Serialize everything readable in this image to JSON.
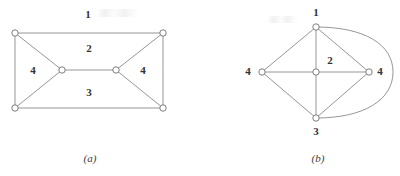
{
  "figure": {
    "caption_a": "(a)",
    "caption_b": "(b)"
  },
  "diagram_a": {
    "name": "planar-graph-a",
    "face_labels": [
      {
        "id": "outer-face-label-1",
        "text": "1",
        "x": 88,
        "y": 14
      },
      {
        "id": "face-label-upper-2",
        "text": "2",
        "x": 89,
        "y": 48
      },
      {
        "id": "face-label-lower-3",
        "text": "3",
        "x": 89,
        "y": 92
      },
      {
        "id": "face-label-left-4",
        "text": "4",
        "x": 33,
        "y": 70
      },
      {
        "id": "face-label-right-4",
        "text": "4",
        "x": 143,
        "y": 70
      }
    ],
    "vertices": [
      {
        "id": "v-top-left",
        "x": 15,
        "y": 33
      },
      {
        "id": "v-top-right",
        "x": 163,
        "y": 33
      },
      {
        "id": "v-bottom-left",
        "x": 15,
        "y": 108
      },
      {
        "id": "v-bottom-right",
        "x": 163,
        "y": 108
      },
      {
        "id": "v-mid-left",
        "x": 62,
        "y": 70
      },
      {
        "id": "v-mid-right",
        "x": 116,
        "y": 70
      }
    ],
    "edges": [
      {
        "id": "edge-top",
        "from": "v-top-left",
        "to": "v-top-right"
      },
      {
        "id": "edge-bottom",
        "from": "v-bottom-left",
        "to": "v-bottom-right"
      },
      {
        "id": "edge-left",
        "from": "v-top-left",
        "to": "v-bottom-left"
      },
      {
        "id": "edge-right",
        "from": "v-top-right",
        "to": "v-bottom-right"
      },
      {
        "id": "edge-tl-midleft",
        "from": "v-top-left",
        "to": "v-mid-left"
      },
      {
        "id": "edge-bl-midleft",
        "from": "v-bottom-left",
        "to": "v-mid-left"
      },
      {
        "id": "edge-tr-midright",
        "from": "v-top-right",
        "to": "v-mid-right"
      },
      {
        "id": "edge-br-midright",
        "from": "v-bottom-right",
        "to": "v-mid-right"
      },
      {
        "id": "edge-mid-bridge",
        "from": "v-mid-left",
        "to": "v-mid-right"
      }
    ]
  },
  "diagram_b": {
    "name": "dual-graph-b",
    "vertex_labels": [
      {
        "id": "vertex-label-1",
        "text": "1",
        "x": 316,
        "y": 12
      },
      {
        "id": "vertex-label-2",
        "text": "2",
        "x": 330,
        "y": 60
      },
      {
        "id": "vertex-label-3",
        "text": "3",
        "x": 316,
        "y": 131
      },
      {
        "id": "vertex-label-left-4",
        "text": "4",
        "x": 248,
        "y": 71
      },
      {
        "id": "vertex-label-right-4",
        "text": "4",
        "x": 380,
        "y": 71
      }
    ],
    "vertices": [
      {
        "id": "v-top-1",
        "x": 316,
        "y": 27
      },
      {
        "id": "v-center-2",
        "x": 316,
        "y": 72
      },
      {
        "id": "v-bottom-3",
        "x": 316,
        "y": 118
      },
      {
        "id": "v-left-4",
        "x": 262,
        "y": 72
      },
      {
        "id": "v-right-4",
        "x": 369,
        "y": 72
      }
    ],
    "edges": [
      {
        "id": "edge-1-left4",
        "from": "v-top-1",
        "to": "v-left-4"
      },
      {
        "id": "edge-1-center2",
        "from": "v-top-1",
        "to": "v-center-2"
      },
      {
        "id": "edge-1-right4",
        "from": "v-top-1",
        "to": "v-right-4"
      },
      {
        "id": "edge-3-left4",
        "from": "v-bottom-3",
        "to": "v-left-4"
      },
      {
        "id": "edge-3-center2",
        "from": "v-bottom-3",
        "to": "v-center-2"
      },
      {
        "id": "edge-3-right4",
        "from": "v-bottom-3",
        "to": "v-right-4"
      },
      {
        "id": "edge-left4-center2",
        "from": "v-left-4",
        "to": "v-center-2"
      },
      {
        "id": "edge-center2-right4",
        "from": "v-center-2",
        "to": "v-right-4"
      },
      {
        "id": "edge-1-3-curved-outer",
        "from": "v-top-1",
        "to": "v-bottom-3",
        "curved": true
      }
    ]
  },
  "colors": {
    "edge": "#8a8a8a",
    "vertex_stroke": "#6f6f6f",
    "vertex_fill": "#ffffff",
    "label_text": "#333333",
    "background": "#ffffff"
  }
}
